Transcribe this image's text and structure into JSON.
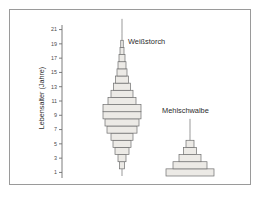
{
  "figure": {
    "yaxis": {
      "title": "Lebensalter (Jahre)",
      "ticks": [
        1,
        3,
        5,
        7,
        9,
        11,
        13,
        15,
        17,
        19,
        21
      ],
      "tick_labels": [
        "1",
        "3",
        "5",
        "7",
        "9",
        "11",
        "13",
        "15",
        "17",
        "19",
        "21"
      ]
    },
    "series_labels": {
      "stork": "Weißstorch",
      "swallow": "Mehlschwalbe"
    },
    "colors": {
      "bar_fill": "#eceae6",
      "bar_stroke": "#6e6e6e",
      "axis": "#6e6e6e",
      "frame": "#9a9a9a",
      "text": "#2b2b2b",
      "background": "#ffffff"
    }
  },
  "chart_data": {
    "type": "bar",
    "title": "",
    "subtitle": "",
    "xlabel": "",
    "ylabel": "Lebensalter (Jahre)",
    "orientation": "horizontal-centered-pyramid",
    "ylim": [
      0,
      22
    ],
    "grid": false,
    "legend_position": "inline-annotation",
    "axis_ticks": [
      1,
      3,
      5,
      7,
      9,
      11,
      13,
      15,
      17,
      19,
      21
    ],
    "series": [
      {
        "name": "Weißstorch",
        "label_x": 118,
        "label_y": 34,
        "center_x": 112,
        "ages": [
          1,
          2,
          3,
          4,
          5,
          6,
          7,
          8,
          9,
          10,
          11,
          12,
          13,
          14,
          15,
          16,
          17,
          18,
          19,
          20,
          21,
          22
        ],
        "values": [
          1.5,
          5.0,
          8.0,
          14.0,
          18.0,
          22.0,
          30.0,
          34.0,
          38.0,
          38.0,
          28.0,
          22.0,
          17.0,
          13.0,
          10.0,
          8.0,
          6.0,
          4.0,
          2.5,
          1.2,
          1.0,
          1.0
        ]
      },
      {
        "name": "Mehlschwalbe",
        "label_x": 152,
        "label_y": 103,
        "center_x": 180,
        "ages": [
          1,
          2,
          3,
          4,
          5,
          6,
          7,
          8
        ],
        "values": [
          48.0,
          34.0,
          22.0,
          13.0,
          8.0,
          1.2,
          1.2,
          1.2
        ]
      }
    ]
  }
}
